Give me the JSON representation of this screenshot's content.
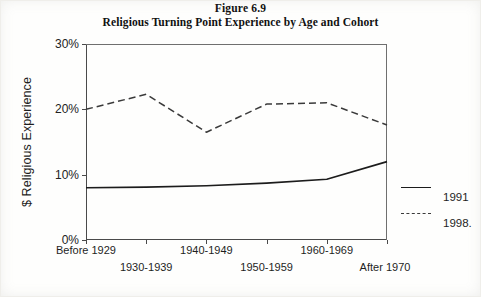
{
  "figure": {
    "number_label": "Figure 6.9",
    "title": "Religious Turning Point Experience by Age and Cohort"
  },
  "axes": {
    "ylabel": "$ Religious Experience",
    "yticks": [
      "0%",
      "10%",
      "20%",
      "30%"
    ]
  },
  "legend": {
    "entries": [
      {
        "label": "1991",
        "style": "solid"
      },
      {
        "label": "1998.",
        "style": "dashed"
      }
    ]
  },
  "chart_data": {
    "type": "line",
    "title": "Religious Turning Point Experience by Age and Cohort",
    "subtitle": "Figure 6.9",
    "xlabel": "",
    "ylabel": "$ Religious Experience",
    "categories": [
      "Before 1929",
      "1930-1939",
      "1940-1949",
      "1950-1959",
      "1960-1969",
      "After 1970"
    ],
    "series": [
      {
        "name": "1991",
        "style": "solid",
        "color": "#1c1c1c",
        "values": [
          8.0,
          8.1,
          8.3,
          8.7,
          9.3,
          12.0
        ]
      },
      {
        "name": "1998.",
        "style": "dashed",
        "color": "#3a3a3a",
        "values": [
          20.0,
          22.3,
          16.5,
          20.8,
          21.0,
          17.6
        ]
      }
    ],
    "ylim": [
      0,
      30
    ],
    "yticks": [
      0,
      10,
      20,
      30
    ],
    "ytick_labels": [
      "0%",
      "10%",
      "20%",
      "30%"
    ],
    "grid": false,
    "legend_position": "right"
  }
}
